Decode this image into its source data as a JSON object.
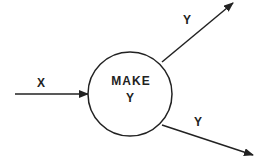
{
  "diagram": {
    "process": {
      "label_line1": "MAKE",
      "label_line2": "Y"
    },
    "input": {
      "label": "X"
    },
    "outputs": [
      {
        "label": "Y"
      },
      {
        "label": "Y"
      }
    ],
    "colors": {
      "stroke": "#222222",
      "background": "#ffffff"
    }
  }
}
